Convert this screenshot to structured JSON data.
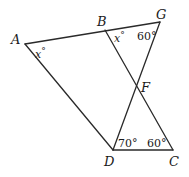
{
  "diagram": {
    "points": {
      "A": {
        "label": "A",
        "x": 25,
        "y": 44
      },
      "B": {
        "label": "B",
        "x": 105,
        "y": 30
      },
      "G": {
        "label": "G",
        "x": 160,
        "y": 22
      },
      "F": {
        "label": "F",
        "x": 136,
        "y": 88
      },
      "D": {
        "label": "D",
        "x": 113,
        "y": 150
      },
      "C": {
        "label": "C",
        "x": 173,
        "y": 150
      }
    },
    "segments": [
      {
        "from": "A",
        "to": "G"
      },
      {
        "from": "A",
        "to": "D"
      },
      {
        "from": "B",
        "to": "C"
      },
      {
        "from": "G",
        "to": "D"
      },
      {
        "from": "D",
        "to": "C"
      }
    ],
    "angles": {
      "A": {
        "var": "x",
        "unit": "°"
      },
      "B": {
        "var": "x",
        "unit": "°"
      },
      "G": {
        "value": "60°"
      },
      "D": {
        "value": "70°"
      },
      "C": {
        "value": "60°"
      }
    }
  }
}
